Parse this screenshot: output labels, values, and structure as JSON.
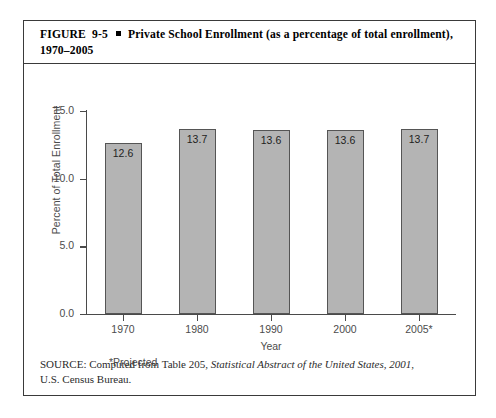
{
  "figure": {
    "label": "FIGURE",
    "number": "9-5",
    "bullet": "square-bullet",
    "caption": "Private School Enrollment (as a percentage of total enrollment), 1970–2005"
  },
  "source": {
    "prefix": "SOURCE: Computed from Table 205,",
    "italic_title": "Statistical Abstract of the United States, 2001",
    "suffix": ",",
    "line2": "U.S. Census Bureau."
  },
  "notes": {
    "projected": "*Projected"
  },
  "colors": {
    "bar_fill": "#b4b4b4",
    "bar_stroke": "#555555",
    "axis": "#4a4a4a",
    "frame": "#3a3a3a",
    "text": "#2b2b2b"
  },
  "chart_data": {
    "type": "bar",
    "title": "Private School Enrollment (as a percentage of total enrollment), 1970–2005",
    "categories": [
      "1970",
      "1980",
      "1990",
      "2000",
      "2005*"
    ],
    "values": [
      12.6,
      13.7,
      13.6,
      13.6,
      13.7
    ],
    "value_labels": [
      "12.6",
      "13.7",
      "13.6",
      "13.6",
      "13.7"
    ],
    "xlabel": "Year",
    "ylabel": "Percent of Total Enrollment",
    "ylim": [
      0.0,
      15.0
    ],
    "yticks": [
      0.0,
      5.0,
      10.0,
      15.0
    ],
    "ytick_labels": [
      "0.0",
      "5.0",
      "10.0",
      "15.0"
    ],
    "grid": false,
    "legend": false
  }
}
